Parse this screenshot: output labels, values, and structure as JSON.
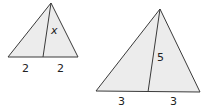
{
  "figure": {
    "small_triangle": {
      "apex": [
        51,
        3
      ],
      "base_left": [
        8,
        57
      ],
      "base_right": [
        78,
        57
      ],
      "median_foot": [
        43,
        57
      ],
      "labels": {
        "median": "x",
        "left_segment": "2",
        "right_segment": "2"
      }
    },
    "large_triangle": {
      "apex": [
        160,
        9
      ],
      "base_left": [
        96,
        91
      ],
      "base_right": [
        200,
        92
      ],
      "median_foot": [
        148,
        92
      ],
      "labels": {
        "median": "5",
        "left_segment": "3",
        "right_segment": "3"
      }
    },
    "colors": {
      "fill": "#ececec",
      "stroke": "#3a3a3a",
      "text": "#222222"
    }
  }
}
